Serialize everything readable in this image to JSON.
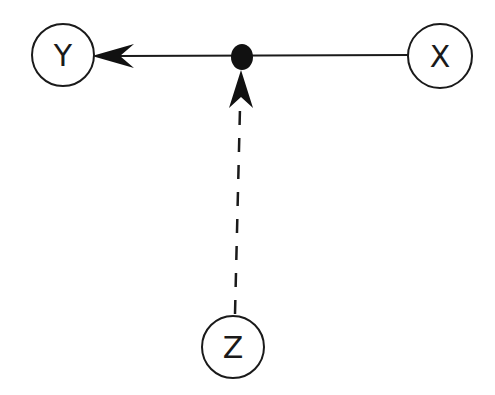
{
  "diagram": {
    "type": "causal-graph",
    "colors": {
      "stroke": "#1a1a1a",
      "fill": "#ffffff",
      "dot": "#111111"
    },
    "nodes": [
      {
        "id": "Y",
        "label": "Y",
        "cx": 63,
        "cy": 55,
        "r": 31
      },
      {
        "id": "X",
        "label": "X",
        "cx": 440,
        "cy": 56,
        "r": 32
      },
      {
        "id": "Z",
        "label": "Z",
        "cx": 233,
        "cy": 347,
        "r": 31
      }
    ],
    "junction": {
      "cx": 242,
      "cy": 56,
      "rx": 11,
      "ry": 13
    },
    "edges": [
      {
        "from": "X",
        "to": "Y",
        "style": "solid",
        "arrow": "at Y"
      },
      {
        "from": "Z",
        "to": "junction",
        "style": "dashed",
        "arrow": "at junction"
      }
    ]
  }
}
